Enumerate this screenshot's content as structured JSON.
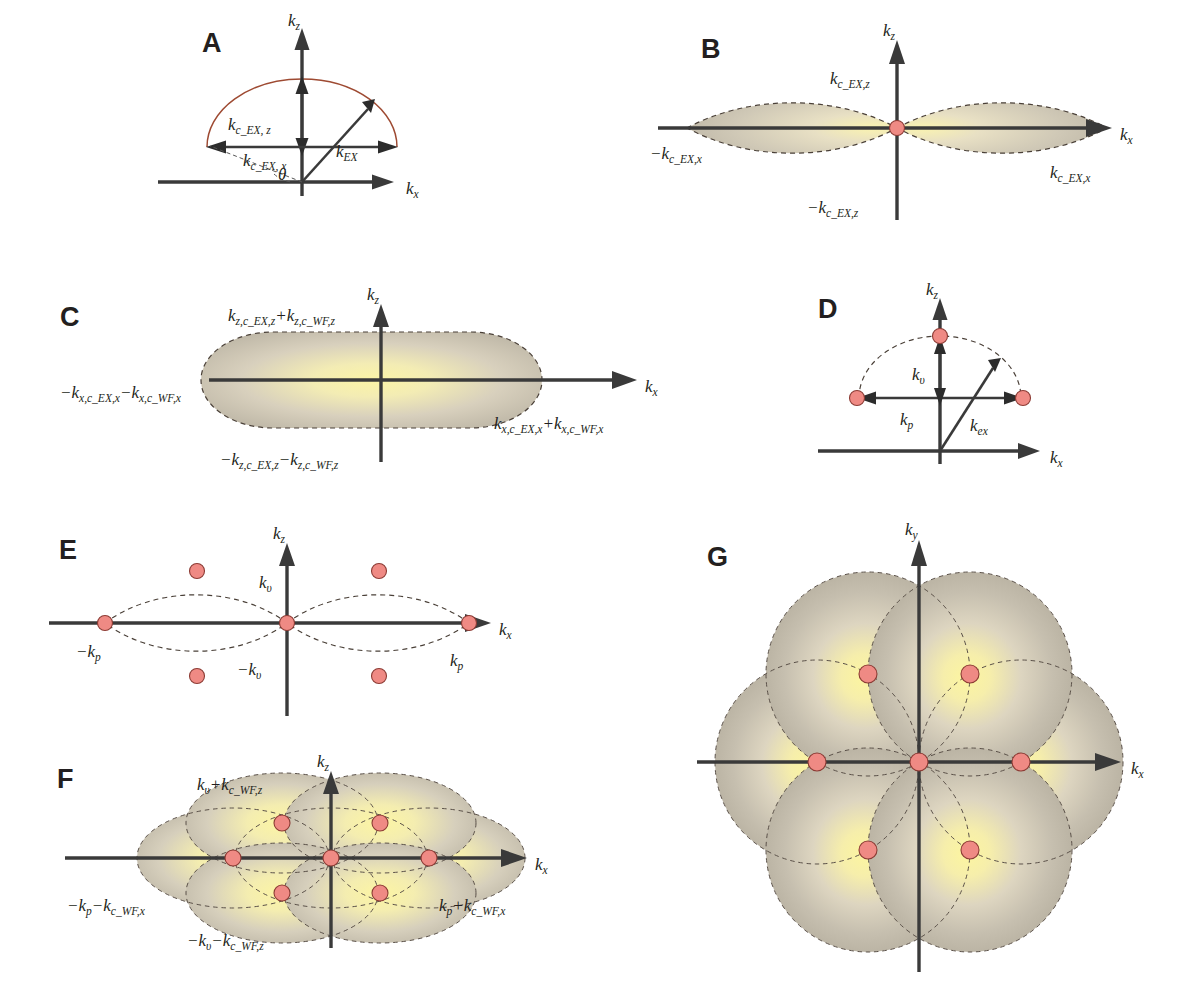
{
  "figure": {
    "type": "diagram",
    "background_color": "#ffffff",
    "accent_dot_color": "#ef8a84",
    "dot_outline_color": "#8c3b34",
    "fill_outer_color": "#bdb6a6",
    "fill_inner_color": "#f7f0a8",
    "arc_color": "#9e4a32",
    "axis_color": "#3a3a3a"
  },
  "panels": [
    {
      "letter": "A",
      "axes": {
        "x": "k",
        "x_sub": "x",
        "y": "k",
        "y_sub": "z"
      },
      "labels": [
        {
          "base": "k",
          "sub": "c_EX, z"
        },
        {
          "base": "k",
          "sub": "c_EX, x"
        },
        {
          "base": "k",
          "sub": "EX"
        },
        {
          "base": "θ",
          "sub": ""
        }
      ],
      "shape": "single solid arc (half ellipse) above origin with double-headed vertical and horizontal extent arrows, plus k_EX vector at angle theta"
    },
    {
      "letter": "B",
      "axes": {
        "x": "k",
        "x_sub": "x",
        "y": "k",
        "y_sub": "z"
      },
      "labels": [
        {
          "base": "k",
          "sub": "c_EX,z"
        },
        {
          "base": "−k",
          "sub": "c_EX,z"
        },
        {
          "base": "−k",
          "sub": "c_EX,x"
        },
        {
          "base": "k",
          "sub": "c_EX,x"
        }
      ],
      "shape": "two filled lens (vesica) regions meeting at the origin, dashed outlines, one red dot at origin"
    },
    {
      "letter": "C",
      "axes": {
        "x": "k",
        "x_sub": "x",
        "y": "k",
        "y_sub": "z"
      },
      "labels": [
        {
          "parts": [
            {
              "base": "k",
              "sub": "z,c_EX,z"
            },
            {
              "op": "+"
            },
            {
              "base": "k",
              "sub": "z,c_WF,z"
            }
          ]
        },
        {
          "parts": [
            {
              "base": "−k",
              "sub": "z,c_EX,z"
            },
            {
              "op": "−"
            },
            {
              "base": "k",
              "sub": "z,c_WF,z"
            }
          ]
        },
        {
          "parts": [
            {
              "base": "−k",
              "sub": "x,c_EX,x"
            },
            {
              "op": "−"
            },
            {
              "base": "k",
              "sub": "x,c_WF,x"
            }
          ]
        },
        {
          "parts": [
            {
              "base": "k",
              "sub": "x,c_EX,x"
            },
            {
              "op": "+"
            },
            {
              "base": "k",
              "sub": "x,c_WF,x"
            }
          ]
        }
      ],
      "shape": "single filled stadium / capsule region with dashed outline centred on origin"
    },
    {
      "letter": "D",
      "axes": {
        "x": "k",
        "x_sub": "x",
        "y": "k",
        "y_sub": "z"
      },
      "labels": [
        {
          "base": "k",
          "sub": "υ"
        },
        {
          "base": "k",
          "sub": "p"
        },
        {
          "base": "k",
          "sub": "ex"
        }
      ],
      "shape": "dashed half-ellipse arc with three red dots (top, left, right), double-headed k_p horizontal arrow, k_upsilon vertical arrow, k_ex vector"
    },
    {
      "letter": "E",
      "axes": {
        "x": "k",
        "x_sub": "x",
        "y": "k",
        "y_sub": "z"
      },
      "labels": [
        {
          "base": "k",
          "sub": "υ"
        },
        {
          "base": "−k",
          "sub": "υ"
        },
        {
          "base": "−k",
          "sub": "p"
        },
        {
          "base": "k",
          "sub": "p"
        }
      ],
      "shape": "two unfilled dashed lens outlines meeting at origin, seven red dots (3 on axis, 2 upper, 2 lower)"
    },
    {
      "letter": "F",
      "axes": {
        "x": "k",
        "x_sub": "x",
        "y": "k",
        "y_sub": "z"
      },
      "labels": [
        {
          "parts": [
            {
              "base": "k",
              "sub": "υ"
            },
            {
              "op": "+"
            },
            {
              "base": "k",
              "sub": "c_WF,z"
            }
          ]
        },
        {
          "parts": [
            {
              "base": "−k",
              "sub": "υ"
            },
            {
              "op": "−"
            },
            {
              "base": "k",
              "sub": "c_WF,z"
            }
          ]
        },
        {
          "parts": [
            {
              "base": "−k",
              "sub": "p"
            },
            {
              "op": "−"
            },
            {
              "base": "k",
              "sub": "c_WF,x"
            }
          ]
        },
        {
          "parts": [
            {
              "base": "k",
              "sub": "p"
            },
            {
              "op": "+"
            },
            {
              "base": "k",
              "sub": "c_WF,x"
            }
          ]
        }
      ],
      "shape": "filled union of seven overlapping ellipses centred on the seven red dots, dashed ellipse outlines visible, overall elongated capsule with pointed side lobes"
    },
    {
      "letter": "G",
      "axes": {
        "x": "k",
        "x_sub": "x",
        "y": "k",
        "y_sub": "y"
      },
      "labels": [],
      "shape": "flower-of-life rosette: six filled circles centred on six hexagonally arranged red dots plus a seventh central dot, dashed circle outlines, radial yellow-to-grey gradient fill"
    }
  ]
}
